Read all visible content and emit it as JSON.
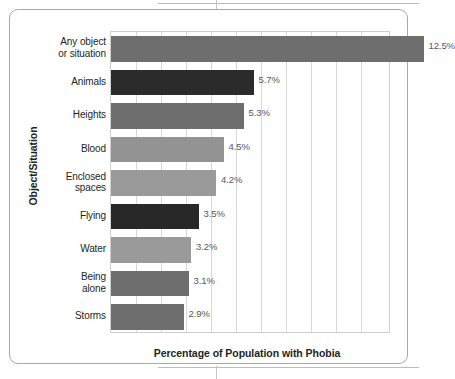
{
  "chart_data": {
    "type": "bar",
    "orientation": "horizontal",
    "title": "",
    "xlabel": "Percentage of Population with Phobia",
    "ylabel": "Object/Situation",
    "xlim": [
      0,
      11.2
    ],
    "grid": true,
    "legend": "none",
    "value_suffix": "%",
    "categories": [
      "Any object or situation",
      "Animals",
      "Heights",
      "Blood",
      "Enclosed spaces",
      "Flying",
      "Water",
      "Being alone",
      "Storms"
    ],
    "values": [
      12.5,
      5.7,
      5.3,
      4.5,
      4.2,
      3.5,
      3.2,
      3.1,
      2.9
    ],
    "value_labels": [
      "12.5%",
      "5.7%",
      "5.3%",
      "4.5%",
      "4.2%",
      "3.5%",
      "3.2%",
      "3.1%",
      "2.9%"
    ],
    "bar_colors": [
      "#6e6e6e",
      "#2b2b2b",
      "#6e6e6e",
      "#939393",
      "#9a9a9a",
      "#282828",
      "#9a9a9a",
      "#6e6e6e",
      "#6e6e6e"
    ],
    "gridline_count": 11,
    "gridline_step": 1
  },
  "axis": {
    "y_title": "Object/Situation",
    "x_title": "Percentage of Population with Phobia"
  },
  "category_label_lines": [
    [
      "Any object",
      "or situation"
    ],
    [
      "Animals"
    ],
    [
      "Heights"
    ],
    [
      "Blood"
    ],
    [
      "Enclosed",
      "spaces"
    ],
    [
      "Flying"
    ],
    [
      "Water"
    ],
    [
      "Being",
      "alone"
    ],
    [
      "Storms"
    ]
  ]
}
